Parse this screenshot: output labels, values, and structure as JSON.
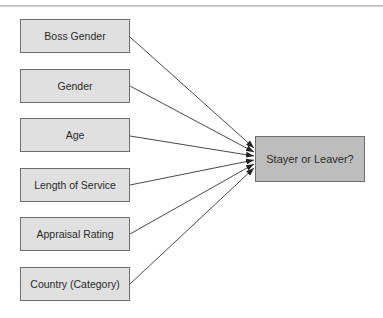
{
  "diagram": {
    "inputs": [
      {
        "label": "Boss Gender"
      },
      {
        "label": "Gender"
      },
      {
        "label": "Age"
      },
      {
        "label": "Length of Service"
      },
      {
        "label": "Appraisal Rating"
      },
      {
        "label": "Country (Category)"
      }
    ],
    "output": {
      "label": "Stayer or Leaver?"
    },
    "colors": {
      "input_fill": "#e0e0e0",
      "output_fill": "#bdbdbd",
      "border": "#6e6e6e",
      "edge": "#333333"
    }
  }
}
